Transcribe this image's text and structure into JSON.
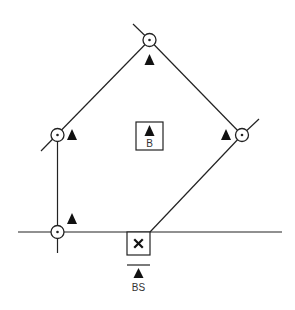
{
  "diagram": {
    "type": "field-layout",
    "colors": {
      "stroke": "#222222",
      "fill": "#ffffff",
      "marker": "#111111"
    },
    "labels": {
      "center_box": "B",
      "bottom_marker": "BS"
    },
    "nodes": [
      {
        "id": "top",
        "symbol": "circle-dot",
        "x": 149.5,
        "y": 40
      },
      {
        "id": "left",
        "symbol": "circle-dot",
        "x": 57.5,
        "y": 135
      },
      {
        "id": "right",
        "symbol": "circle-dot",
        "x": 242,
        "y": 135
      },
      {
        "id": "bottom-left",
        "symbol": "circle-dot",
        "x": 57.5,
        "y": 232
      },
      {
        "id": "home-box",
        "symbol": "box-x",
        "x": 138.5,
        "y": 243.5
      }
    ],
    "markers": [
      {
        "id": "tri-top",
        "symbol": "triangle",
        "x": 149.5,
        "y": 60
      },
      {
        "id": "tri-left",
        "symbol": "triangle",
        "x": 72,
        "y": 135
      },
      {
        "id": "tri-right",
        "symbol": "triangle",
        "x": 226,
        "y": 135
      },
      {
        "id": "tri-bottom-left",
        "symbol": "triangle",
        "x": 72,
        "y": 218
      },
      {
        "id": "tri-center",
        "symbol": "triangle",
        "x": 149.5,
        "y": 131
      },
      {
        "id": "tri-bs",
        "symbol": "triangle",
        "x": 138.5,
        "y": 273
      }
    ]
  }
}
